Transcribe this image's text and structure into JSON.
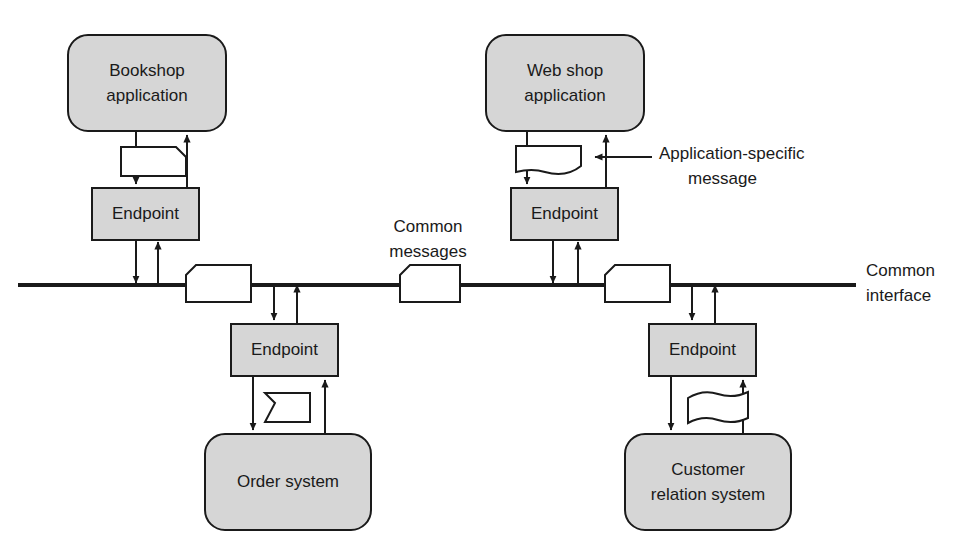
{
  "diagram": {
    "colors": {
      "node_fill": "#d6d6d6",
      "stroke": "#1a1a1a",
      "message_fill": "#ffffff",
      "background": "#ffffff"
    },
    "applications": [
      {
        "id": "bookshop",
        "line1": "Bookshop",
        "line2": "application"
      },
      {
        "id": "webshop",
        "line1": "Web shop",
        "line2": "application"
      },
      {
        "id": "order",
        "line1": "Order system",
        "line2": ""
      },
      {
        "id": "customer",
        "line1": "Customer",
        "line2": "relation system"
      }
    ],
    "endpoints": [
      {
        "id": "endpoint-bookshop",
        "label": "Endpoint"
      },
      {
        "id": "endpoint-webshop",
        "label": "Endpoint"
      },
      {
        "id": "endpoint-order",
        "label": "Endpoint"
      },
      {
        "id": "endpoint-customer",
        "label": "Endpoint"
      }
    ],
    "annotations": {
      "common_messages_line1": "Common",
      "common_messages_line2": "messages",
      "application_specific_line1": "Application-specific",
      "application_specific_line2": "message",
      "common_interface_line1": "Common",
      "common_interface_line2": "interface"
    },
    "messages": [
      {
        "id": "msg-bookshop",
        "kind": "clipped-corner",
        "owner": "bookshop"
      },
      {
        "id": "msg-webshop",
        "kind": "flag-wave-bottom",
        "owner": "webshop"
      },
      {
        "id": "msg-order",
        "kind": "clipped-corner",
        "owner": "order"
      },
      {
        "id": "msg-customer",
        "kind": "flag-wave-full",
        "owner": "customer"
      },
      {
        "id": "msg-bus-1",
        "kind": "clipped-corner-left",
        "owner": "bus"
      },
      {
        "id": "msg-bus-2",
        "kind": "clipped-corner-left",
        "owner": "bus"
      },
      {
        "id": "msg-bus-3",
        "kind": "clipped-corner-left",
        "owner": "bus"
      }
    ]
  }
}
